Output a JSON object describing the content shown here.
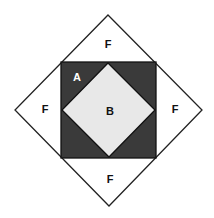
{
  "diagram": {
    "outer_diamond": {
      "top": [
        108,
        15
      ],
      "right": [
        202,
        110
      ],
      "bottom": [
        109,
        206
      ],
      "left": [
        15,
        110
      ],
      "fill": "#ffffff",
      "stroke": "#222222"
    },
    "dark_square": {
      "x": 61,
      "y": 62,
      "w": 95,
      "h": 96,
      "fill": "#3a3a3a",
      "stroke": "#111111"
    },
    "inner_diamond": {
      "top": [
        108,
        63
      ],
      "right": [
        155,
        110
      ],
      "bottom": [
        109,
        157
      ],
      "left": [
        62,
        110
      ],
      "fill": "#e8e8e8",
      "stroke": "#111111"
    },
    "labels": {
      "f_top": "F",
      "f_left": "F",
      "f_right": "F",
      "f_bottom": "F",
      "a": "A",
      "b": "B"
    }
  }
}
